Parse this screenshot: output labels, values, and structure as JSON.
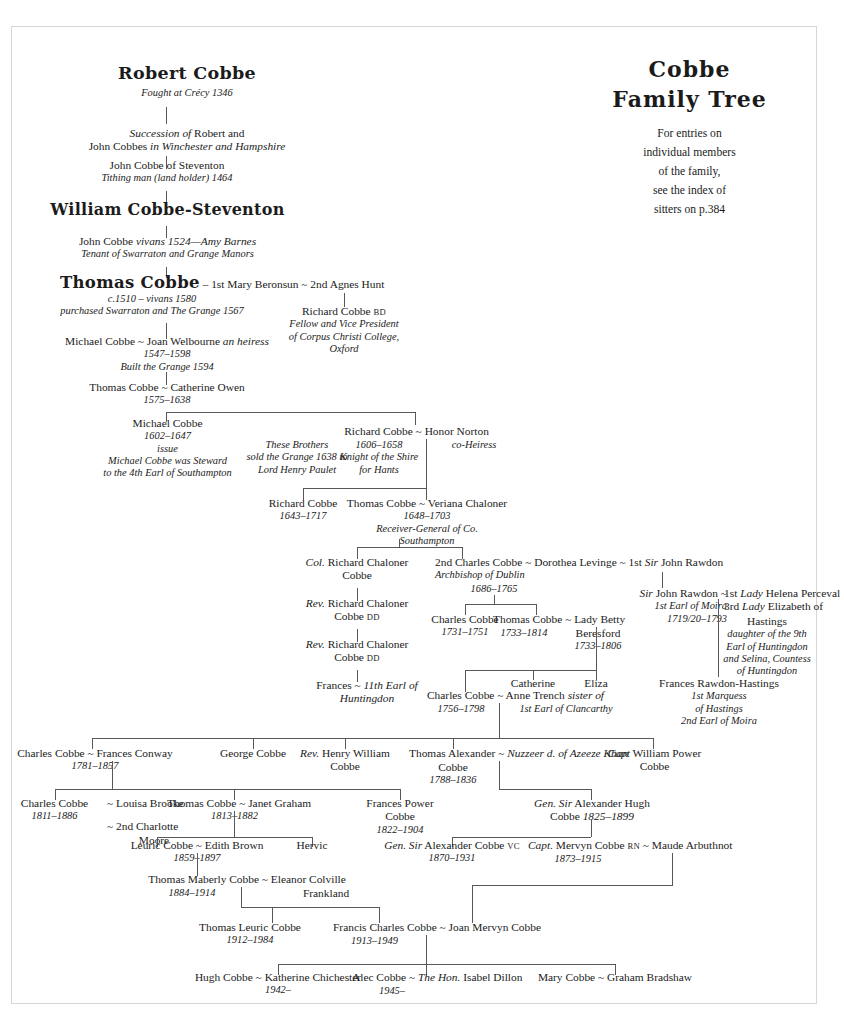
{
  "title": {
    "line1": "Cobbe",
    "line2": "Family Tree",
    "note": [
      "For entries on",
      "individual members",
      "of the family,",
      "see the index of",
      "sitters on p.384"
    ]
  },
  "people": {
    "robert_cobbe": {
      "name": "Robert Cobbe",
      "note": "Fought at Crécy 1346"
    },
    "succession": {
      "l1_i": "Succession of",
      "l1_r": " Robert and",
      "l2_r": "John Cobbes ",
      "l2_i": "in Winchester and Hampshire"
    },
    "john_cobbe_steventon": {
      "name": "John Cobbe of Steventon",
      "note": "Tithing man (land holder) 1464"
    },
    "william_cobbe_steventon": {
      "name": "William Cobbe-Steventon"
    },
    "john_cobbe_vivans": {
      "name_r": "John Cobbe ",
      "name_i": "vivans 1524—Amy Barnes",
      "note": "Tenant of Swarraton and Grange Manors"
    },
    "thomas_cobbe_1510": {
      "name": "Thomas Cobbe",
      "spouses": " – 1st Mary Beronsun ~ 2nd Agnes Hunt",
      "dates": "c.1510 – vivans 1580",
      "note": "purchased Swarraton and The Grange 1567"
    },
    "richard_cobbe_bd": {
      "name": "Richard Cobbe ",
      "suffix": "BD",
      "note": [
        "Fellow and Vice President",
        "of Corpus Christi College,",
        "Oxford"
      ]
    },
    "michael_cobbe_1547": {
      "name": "Michael Cobbe ~ Joan Welbourne ",
      "name_i": "an heiress",
      "dates": "1547–1598",
      "note": "Built the Grange 1594"
    },
    "thomas_cobbe_1575": {
      "name": "Thomas Cobbe ~ Catherine Owen",
      "dates": "1575–1638"
    },
    "michael_cobbe_1602": {
      "name": "Michael Cobbe",
      "dates": "1602–1647",
      "note": [
        "issue",
        "Michael Cobbe was Steward",
        "to the 4th Earl of Southampton"
      ]
    },
    "these_brothers": {
      "note": [
        "These Brothers",
        "sold the Grange 1638 to",
        "Lord Henry Paulet"
      ]
    },
    "richard_cobbe_1606": {
      "name": "Richard Cobbe ~ Honor Norton",
      "spouse_note": "co-Heiress",
      "dates": "1606–1658",
      "note": [
        "Knight of the Shire",
        "for Hants"
      ]
    },
    "richard_cobbe_1643": {
      "name": "Richard Cobbe",
      "dates": "1643–1717"
    },
    "thomas_cobbe_1648": {
      "name": "Thomas Cobbe  ~  Veriana Chaloner",
      "dates": "1648–1703",
      "note": [
        "Receiver-General of Co.",
        "Southampton"
      ]
    },
    "col_richard_chaloner": {
      "prefix": "Col.",
      "name": " Richard Chaloner",
      "line2": "Cobbe"
    },
    "rev_richard_chaloner_1": {
      "prefix": "Rev.",
      "name": " Richard Chaloner",
      "line2": "Cobbe ",
      "suffix": "DD"
    },
    "rev_richard_chaloner_2": {
      "prefix": "Rev.",
      "name": " Richard Chaloner",
      "line2": "Cobbe ",
      "suffix": "DD"
    },
    "frances_huntingdon": {
      "name": "Frances ~ ",
      "name_i": "11th Earl of",
      "line2_i": "Huntingdon"
    },
    "charles_cobbe_abp": {
      "name": "2nd Charles Cobbe ~ Dorothea Levinge ~ ",
      "ord": "1st ",
      "sir": "Sir",
      "rawdon": " John Rawdon",
      "note": "Archbishop of Dublin",
      "dates": "1686–1765"
    },
    "charles_cobbe_1731": {
      "name": "Charles Cobbe",
      "dates": "1731–1751"
    },
    "thomas_cobbe_1733": {
      "name": "Thomas Cobbe ~ ",
      "spouse": "Lady Betty",
      "line2": "Beresford",
      "dates": "1733–1806",
      "own_dates": "1733–1814"
    },
    "sir_john_rawdon": {
      "l1_i": "Sir",
      "l1_r": " John Rawdon  ~  ",
      "l1_ord": "1st ",
      "l1_lady": "Lady",
      "l1_end": " Helena Perceval",
      "l2_i": "1st Earl of Moira",
      "l2_sep": "  ~  ",
      "l2_ord": "3rd ",
      "l2_lady": "Lady",
      "l2_end": " Elizabeth of",
      "l3_dates": "1719/20–1793",
      "l3_r": "Hastings",
      "note": [
        "daughter of the 9th",
        "Earl of Huntingdon",
        "and Selina, Countess",
        "of Huntingdon"
      ]
    },
    "catherine": {
      "name": "Catherine"
    },
    "eliza": {
      "name": "Eliza"
    },
    "frances_rawdon_hastings": {
      "name": "Frances Rawdon-Hastings",
      "note": [
        "1st Marquess",
        "of Hastings",
        "2nd Earl of Moira"
      ]
    },
    "charles_cobbe_1756": {
      "name": "Charles Cobbe  ~  Anne Trench ",
      "name_i": "sister of",
      "line2_i": "1st Earl of Clancarthy",
      "dates": "1756–1798"
    },
    "charles_cobbe_1781": {
      "name": "Charles Cobbe  ~  Frances Conway",
      "dates": "1781–1857"
    },
    "george_cobbe": {
      "name": "George Cobbe"
    },
    "rev_henry_william": {
      "prefix": "Rev.",
      "name": " Henry William",
      "line2": "Cobbe"
    },
    "thomas_alexander": {
      "name": "Thomas Alexander  ~  ",
      "spouse_i": "Nuzzeer d. of Azeeze Khan",
      "line2": "Cobbe",
      "dates": "1788–1836"
    },
    "capt_william_power": {
      "prefix": "Capt",
      "name": " William Power",
      "line2": "Cobbe"
    },
    "charles_cobbe_1811": {
      "name": "Charles Cobbe  ~  Louisa Brooke",
      "dates": "1811–1886",
      "line3": "~  2nd Charlotte",
      "line4": "Moore"
    },
    "thomas_cobbe_1813": {
      "name": "Thomas Cobbe  ~  Janet Graham",
      "dates": "1813–1882"
    },
    "frances_power_cobbe": {
      "name": "Frances Power",
      "line2": "Cobbe",
      "dates": "1822–1904"
    },
    "gen_sir_alexander_hugh": {
      "prefix": "Gen. Sir",
      "name": " Alexander Hugh",
      "line2": "Cobbe ",
      "dates": "1825–1899"
    },
    "leuric_cobbe": {
      "name": "Leuric Cobbe  ~  Edith Brown",
      "dates": "1859–1897"
    },
    "hervic": {
      "name": "Hervic"
    },
    "gen_sir_alexander_vc": {
      "prefix": "Gen. Sir",
      "name": " Alexander Cobbe ",
      "suffix": "VC",
      "dates": "1870–1931"
    },
    "capt_mervyn": {
      "prefix": "Capt.",
      "name": " Mervyn Cobbe ",
      "suffix": "RN",
      "spouse": " ~ Maude Arbuthnot",
      "dates": "1873–1915"
    },
    "thomas_maberly": {
      "name": "Thomas Maberly Cobbe  ~  Eleanor Colville",
      "line2": "Frankland",
      "dates": "1884–1914"
    },
    "thomas_leuric": {
      "name": "Thomas Leuric Cobbe",
      "dates": "1912–1984"
    },
    "francis_charles": {
      "name": "Francis Charles Cobbe  ~  Joan Mervyn Cobbe",
      "dates": "1913–1949"
    },
    "hugh_cobbe": {
      "name": "Hugh Cobbe  ~  Katherine Chichester",
      "dates": "1942–"
    },
    "alec_cobbe": {
      "name": "Alec Cobbe  ~  ",
      "hon": "The Hon.",
      "spouse": " Isabel Dillon",
      "dates": "1945–"
    },
    "mary_cobbe": {
      "name": "Mary Cobbe  ~  Graham Bradshaw"
    }
  },
  "colors": {
    "line": "#58585c",
    "text": "#1b1b1b",
    "border": "#d6d6d6"
  }
}
